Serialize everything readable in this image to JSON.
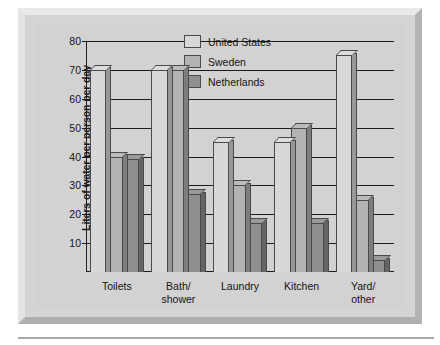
{
  "chart_data": {
    "type": "bar",
    "title": "",
    "xlabel": "",
    "ylabel": "Liters of water per person per day",
    "categories": [
      "Toilets",
      "Bath/\nshower",
      "Laundry",
      "Kitchen",
      "Yard/\nother"
    ],
    "series": [
      {
        "name": "United States",
        "values": [
          70,
          70,
          45,
          45,
          75
        ],
        "color": "#d8d8d8"
      },
      {
        "name": "Sweden",
        "values": [
          40,
          70,
          30,
          50,
          25
        ],
        "color": "#b3b3b3"
      },
      {
        "name": "Netherlands",
        "values": [
          39,
          27,
          17,
          17,
          4
        ],
        "color": "#8f8f8f"
      }
    ],
    "ylim": [
      0,
      80
    ],
    "yticks": [
      10,
      20,
      30,
      40,
      50,
      60,
      70,
      80
    ],
    "grid": true,
    "legend_position": "upper center"
  },
  "legend": {
    "items": [
      {
        "label": "United States"
      },
      {
        "label": "Sweden"
      },
      {
        "label": "Netherlands"
      }
    ]
  },
  "axis": {
    "y_title": "Liters of water per person per day",
    "tick_labels": [
      "10",
      "20",
      "30",
      "40",
      "50",
      "60",
      "70",
      "80"
    ]
  },
  "xaxis": {
    "labels": [
      {
        "line1": "Toilets",
        "line2": ""
      },
      {
        "line1": "Bath/",
        "line2": "shower"
      },
      {
        "line1": "Laundry",
        "line2": ""
      },
      {
        "line1": "Kitchen",
        "line2": ""
      },
      {
        "line1": "Yard/",
        "line2": "other"
      }
    ]
  }
}
